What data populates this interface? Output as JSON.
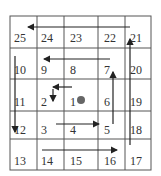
{
  "diagram": {
    "type": "spiral-grid",
    "rows": [
      [
        "25",
        "24",
        "23",
        "22",
        "21"
      ],
      [
        "10",
        "9",
        "8",
        "7",
        "20"
      ],
      [
        "11",
        "2",
        "1",
        "6",
        "19"
      ],
      [
        "12",
        "3",
        "4",
        "5",
        "18"
      ],
      [
        "13",
        "14",
        "15",
        "16",
        "17"
      ]
    ],
    "center_marker": "dot at cell 1",
    "colors": {
      "line": "#444444",
      "dot": "#666666",
      "text": "#333333"
    }
  }
}
